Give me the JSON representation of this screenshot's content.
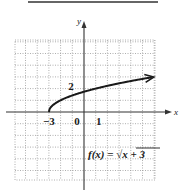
{
  "chart_data": {
    "type": "line",
    "title": "",
    "function_label": "f(x) = √(x + 3)",
    "function_label_parts": {
      "lhs": "f(x) = ",
      "radicand": "x + 3"
    },
    "xlabel": "x",
    "ylabel": "y",
    "xlim": [
      -6,
      6
    ],
    "ylim": [
      -6,
      6
    ],
    "grid": true,
    "tick_labels": {
      "x": [
        {
          "value": -3,
          "label": "−3"
        },
        {
          "value": 0,
          "label": "0"
        },
        {
          "value": 1,
          "label": "1"
        }
      ],
      "y": [
        {
          "value": 2,
          "label": "2"
        }
      ]
    },
    "series": [
      {
        "name": "f(x) = sqrt(x+3)",
        "start_point": [
          -3,
          0
        ],
        "x": [
          -3,
          -2.75,
          -2,
          -1,
          0,
          1,
          2,
          3,
          4,
          5,
          6
        ],
        "y": [
          0,
          0.5,
          1,
          1.414,
          1.732,
          2,
          2.236,
          2.449,
          2.646,
          2.828,
          3
        ],
        "arrow_end": true
      }
    ]
  },
  "colors": {
    "curve": "#1a1a1a",
    "axis": "#333333",
    "grid": "#9a9a9a"
  }
}
